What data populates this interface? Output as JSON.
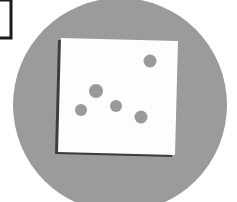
{
  "canvas": {
    "width": 237,
    "height": 202,
    "background_color": "#ffffff"
  },
  "illustration": {
    "title": "Dots scattered on a white card over a gray circle",
    "elements": [
      {
        "name": "corner-frame",
        "role": "partial rectangle outline cropped at left edge",
        "stroke_color": "#1a1a1a",
        "fill_color": "#ffffff",
        "x": -9,
        "y": 0,
        "width": 20,
        "height": 38,
        "stroke_width": 3
      },
      {
        "name": "gray-circle",
        "role": "large background disc, cropped at bottom",
        "fill_color": "#9b9b9b",
        "cx": 120,
        "cy": 105,
        "r": 107
      },
      {
        "name": "card-shadow",
        "role": "dark shadow behind white card on left and bottom",
        "fill_color": "#3d3d3d"
      },
      {
        "name": "white-card",
        "role": "tilted white square page",
        "fill_color": "#fdfdfd",
        "rotation_degrees": -2.5,
        "corners": [
          [
            61,
            38
          ],
          [
            178,
            41
          ],
          [
            175,
            155
          ],
          [
            58,
            152
          ]
        ]
      }
    ],
    "dots": [
      {
        "id": "dot-1",
        "cx": 150,
        "cy": 61,
        "r": 6.5,
        "color": "#9a9a9a"
      },
      {
        "id": "dot-2",
        "cx": 96,
        "cy": 91,
        "r": 7.0,
        "color": "#9a9a9a"
      },
      {
        "id": "dot-3",
        "cx": 81,
        "cy": 110,
        "r": 6.0,
        "color": "#9a9a9a"
      },
      {
        "id": "dot-4",
        "cx": 116,
        "cy": 106,
        "r": 6.0,
        "color": "#9a9a9a"
      },
      {
        "id": "dot-5",
        "cx": 141,
        "cy": 117,
        "r": 6.5,
        "color": "#9a9a9a"
      }
    ]
  }
}
